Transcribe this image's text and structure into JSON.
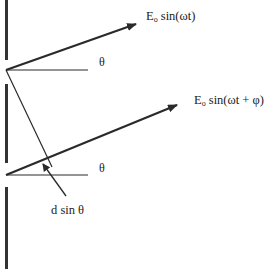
{
  "diagram": {
    "labels": {
      "wave_top": {
        "base": "E",
        "sub": "o",
        "rest": " sin(ωt)"
      },
      "wave_bottom": {
        "base": "E",
        "sub": "o",
        "rest": " sin(ωt + φ)"
      },
      "angle_top": "θ",
      "angle_bottom": "θ",
      "path_difference": "d sin θ"
    },
    "colors": {
      "line": "#2a2a2a",
      "wall": "#333333",
      "background": "#ffffff"
    },
    "elements": {
      "wall_segments": 3,
      "slits": 2,
      "rays": 2
    }
  }
}
